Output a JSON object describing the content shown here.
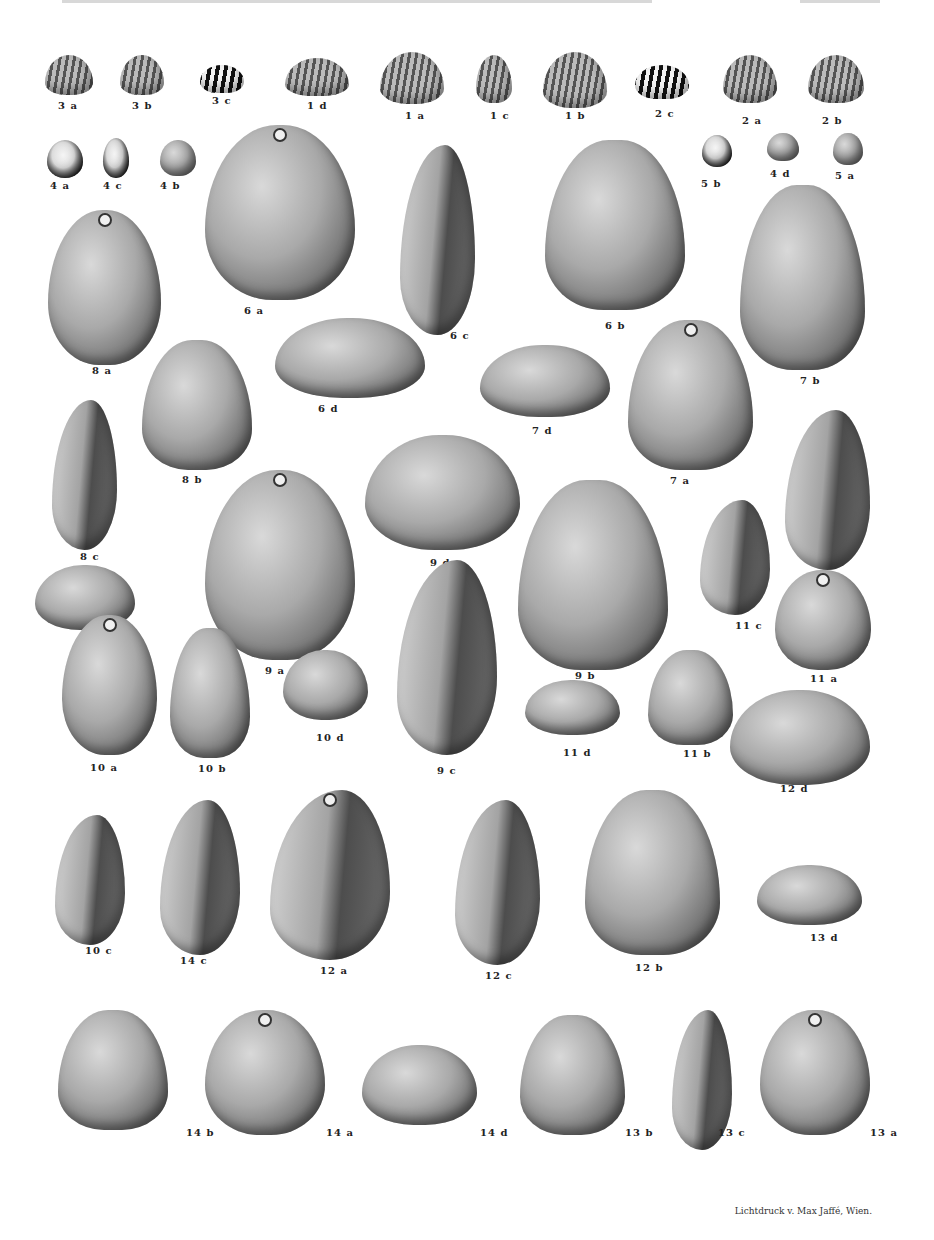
{
  "plate": {
    "header_visible": "cut off at top edge",
    "credit": "Lichtdruck v. Max Jaffé, Wien."
  },
  "specimens": [
    {
      "id": "3a",
      "x": 45,
      "y": 55,
      "w": 48,
      "h": 40,
      "style": "ribbed",
      "lx": 58,
      "ly": 100
    },
    {
      "id": "3b",
      "x": 120,
      "y": 55,
      "w": 44,
      "h": 40,
      "style": "ribbed",
      "lx": 132,
      "ly": 100
    },
    {
      "id": "3c",
      "x": 200,
      "y": 65,
      "w": 44,
      "h": 28,
      "style": "zebra",
      "lx": 212,
      "ly": 95
    },
    {
      "id": "1d",
      "x": 285,
      "y": 58,
      "w": 64,
      "h": 38,
      "style": "ribbed",
      "lx": 307,
      "ly": 100
    },
    {
      "id": "1a",
      "x": 380,
      "y": 52,
      "w": 64,
      "h": 52,
      "style": "ribbed",
      "lx": 405,
      "ly": 110
    },
    {
      "id": "1c",
      "x": 476,
      "y": 55,
      "w": 36,
      "h": 48,
      "style": "ribbed",
      "lx": 490,
      "ly": 110
    },
    {
      "id": "1b",
      "x": 543,
      "y": 52,
      "w": 64,
      "h": 56,
      "style": "ribbed",
      "lx": 565,
      "ly": 110
    },
    {
      "id": "2c",
      "x": 635,
      "y": 65,
      "w": 54,
      "h": 34,
      "style": "zebra",
      "lx": 655,
      "ly": 108
    },
    {
      "id": "2a",
      "x": 723,
      "y": 55,
      "w": 54,
      "h": 48,
      "style": "ribbed",
      "lx": 742,
      "ly": 115
    },
    {
      "id": "2b",
      "x": 808,
      "y": 55,
      "w": 56,
      "h": 48,
      "style": "ribbed",
      "lx": 822,
      "ly": 115
    },
    {
      "id": "4a",
      "x": 47,
      "y": 140,
      "w": 36,
      "h": 38,
      "style": "dark",
      "lx": 50,
      "ly": 180
    },
    {
      "id": "4c",
      "x": 103,
      "y": 138,
      "w": 26,
      "h": 40,
      "style": "dark",
      "lx": 103,
      "ly": 180
    },
    {
      "id": "4b",
      "x": 160,
      "y": 140,
      "w": 36,
      "h": 36,
      "style": "wide",
      "lx": 160,
      "ly": 180
    },
    {
      "id": "5b",
      "x": 702,
      "y": 135,
      "w": 30,
      "h": 32,
      "style": "dark",
      "lx": 701,
      "ly": 178
    },
    {
      "id": "4d",
      "x": 767,
      "y": 133,
      "w": 32,
      "h": 28,
      "style": "wide",
      "lx": 770,
      "ly": 168
    },
    {
      "id": "5a",
      "x": 833,
      "y": 133,
      "w": 30,
      "h": 32,
      "style": "wide",
      "lx": 835,
      "ly": 170
    },
    {
      "id": "6a",
      "x": 205,
      "y": 125,
      "w": 150,
      "h": 175,
      "style": "wide",
      "beak": true,
      "lx": 244,
      "ly": 305
    },
    {
      "id": "6c",
      "x": 400,
      "y": 145,
      "w": 75,
      "h": 190,
      "style": "side",
      "lx": 450,
      "ly": 330
    },
    {
      "id": "6b",
      "x": 545,
      "y": 140,
      "w": 140,
      "h": 170,
      "style": "pointed",
      "lx": 605,
      "ly": 320
    },
    {
      "id": "8a",
      "x": 48,
      "y": 210,
      "w": 113,
      "h": 155,
      "style": "wide",
      "beak": true,
      "lx": 92,
      "ly": 365
    },
    {
      "id": "7b",
      "x": 740,
      "y": 185,
      "w": 125,
      "h": 185,
      "style": "pointed",
      "lx": 800,
      "ly": 375
    },
    {
      "id": "6d",
      "x": 275,
      "y": 318,
      "w": 150,
      "h": 80,
      "style": "wide",
      "lx": 318,
      "ly": 403
    },
    {
      "id": "7d",
      "x": 480,
      "y": 345,
      "w": 130,
      "h": 72,
      "style": "wide",
      "lx": 532,
      "ly": 425
    },
    {
      "id": "8b",
      "x": 142,
      "y": 340,
      "w": 110,
      "h": 130,
      "style": "pointed",
      "lx": 182,
      "ly": 474
    },
    {
      "id": "8c",
      "x": 52,
      "y": 400,
      "w": 65,
      "h": 150,
      "style": "side",
      "lx": 80,
      "ly": 551
    },
    {
      "id": "7a",
      "x": 628,
      "y": 320,
      "w": 125,
      "h": 150,
      "style": "pointed",
      "beak": true,
      "lx": 670,
      "ly": 475
    },
    {
      "id": "7c",
      "x": 785,
      "y": 410,
      "w": 85,
      "h": 160,
      "style": "side",
      "lx": 817,
      "ly": 575
    },
    {
      "id": "9d",
      "x": 365,
      "y": 435,
      "w": 155,
      "h": 115,
      "style": "wide",
      "lx": 430,
      "ly": 557
    },
    {
      "id": "9a",
      "x": 205,
      "y": 470,
      "w": 150,
      "h": 190,
      "style": "wide",
      "beak": true,
      "lx": 265,
      "ly": 665
    },
    {
      "id": "9b",
      "x": 518,
      "y": 480,
      "w": 150,
      "h": 190,
      "style": "pointed",
      "lx": 575,
      "ly": 670
    },
    {
      "id": "8d",
      "x": 35,
      "y": 565,
      "w": 100,
      "h": 65,
      "style": "wide",
      "lx": 90,
      "ly": 638
    },
    {
      "id": "11c",
      "x": 700,
      "y": 500,
      "w": 70,
      "h": 115,
      "style": "side",
      "lx": 735,
      "ly": 620
    },
    {
      "id": "11a",
      "x": 775,
      "y": 570,
      "w": 96,
      "h": 100,
      "style": "wide",
      "beak": true,
      "lx": 810,
      "ly": 673
    },
    {
      "id": "9c",
      "x": 397,
      "y": 560,
      "w": 100,
      "h": 195,
      "style": "side",
      "lx": 437,
      "ly": 765
    },
    {
      "id": "10a",
      "x": 62,
      "y": 615,
      "w": 95,
      "h": 140,
      "style": "wide",
      "beak": true,
      "lx": 90,
      "ly": 762
    },
    {
      "id": "10b",
      "x": 170,
      "y": 628,
      "w": 80,
      "h": 130,
      "style": "pointed",
      "lx": 198,
      "ly": 763
    },
    {
      "id": "10d",
      "x": 283,
      "y": 650,
      "w": 85,
      "h": 70,
      "style": "wide",
      "lx": 316,
      "ly": 732
    },
    {
      "id": "11d",
      "x": 525,
      "y": 680,
      "w": 95,
      "h": 55,
      "style": "wide",
      "lx": 563,
      "ly": 747
    },
    {
      "id": "11b",
      "x": 648,
      "y": 650,
      "w": 85,
      "h": 95,
      "style": "pointed",
      "lx": 683,
      "ly": 748
    },
    {
      "id": "12d",
      "x": 730,
      "y": 690,
      "w": 140,
      "h": 95,
      "style": "wide",
      "lx": 780,
      "ly": 783
    },
    {
      "id": "10c",
      "x": 55,
      "y": 815,
      "w": 70,
      "h": 130,
      "style": "side",
      "lx": 85,
      "ly": 945
    },
    {
      "id": "14c",
      "x": 160,
      "y": 800,
      "w": 80,
      "h": 155,
      "style": "side",
      "lx": 180,
      "ly": 955
    },
    {
      "id": "12a",
      "x": 270,
      "y": 790,
      "w": 120,
      "h": 170,
      "style": "side",
      "beak": true,
      "lx": 320,
      "ly": 965
    },
    {
      "id": "12c",
      "x": 455,
      "y": 800,
      "w": 85,
      "h": 165,
      "style": "side",
      "lx": 485,
      "ly": 970
    },
    {
      "id": "12b",
      "x": 585,
      "y": 790,
      "w": 135,
      "h": 165,
      "style": "pointed",
      "lx": 635,
      "ly": 962
    },
    {
      "id": "13d",
      "x": 757,
      "y": 865,
      "w": 105,
      "h": 60,
      "style": "wide",
      "lx": 810,
      "ly": 932
    },
    {
      "id": "14b",
      "x": 58,
      "y": 1010,
      "w": 110,
      "h": 120,
      "style": "pointed",
      "lx": 186,
      "ly": 1127
    },
    {
      "id": "14a",
      "x": 205,
      "y": 1010,
      "w": 120,
      "h": 125,
      "style": "wide",
      "beak": true,
      "lx": 326,
      "ly": 1127
    },
    {
      "id": "14d",
      "x": 362,
      "y": 1045,
      "w": 115,
      "h": 80,
      "style": "wide",
      "lx": 480,
      "ly": 1127
    },
    {
      "id": "13b",
      "x": 520,
      "y": 1015,
      "w": 105,
      "h": 120,
      "style": "pointed",
      "lx": 625,
      "ly": 1127
    },
    {
      "id": "13c",
      "x": 672,
      "y": 1010,
      "w": 60,
      "h": 140,
      "style": "side",
      "lx": 718,
      "ly": 1127
    },
    {
      "id": "13a",
      "x": 760,
      "y": 1010,
      "w": 110,
      "h": 125,
      "style": "wide",
      "beak": true,
      "lx": 870,
      "ly": 1127
    }
  ]
}
